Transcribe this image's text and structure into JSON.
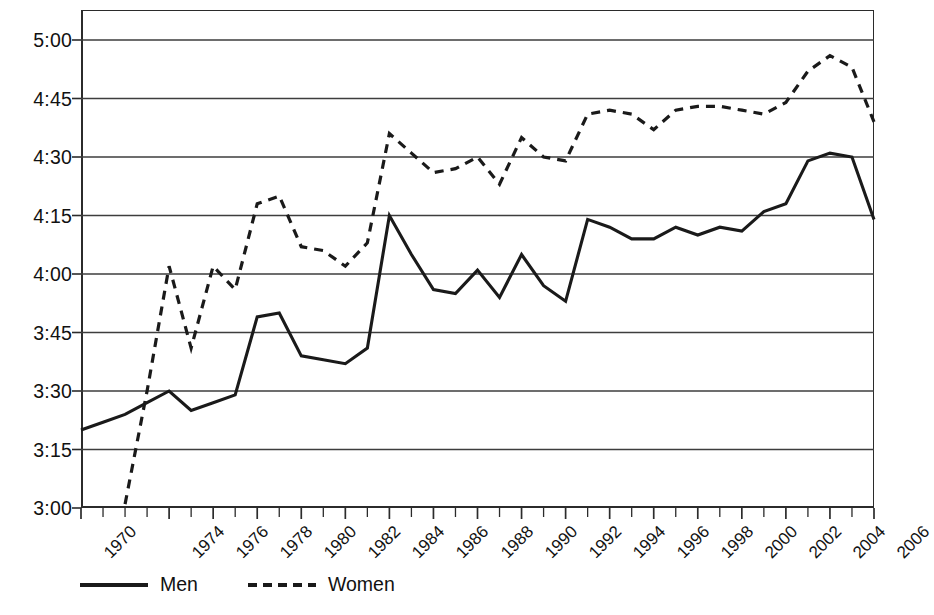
{
  "chart_data": {
    "type": "line",
    "title": "",
    "xlabel": "",
    "ylabel": "",
    "ylim": [
      "3:00",
      "5:00"
    ],
    "xlim": [
      1970,
      2006
    ],
    "grid": true,
    "legend_position": "bottom-left",
    "y_tick_labels": [
      "5:00",
      "4:45",
      "4:30",
      "4:15",
      "4:00",
      "3:45",
      "3:30",
      "3:15",
      "3:00"
    ],
    "y_tick_minutes": [
      300,
      285,
      270,
      255,
      240,
      225,
      210,
      195,
      180
    ],
    "x_tick_years": [
      1970,
      1971,
      1972,
      1973,
      1974,
      1975,
      1976,
      1977,
      1978,
      1979,
      1980,
      1981,
      1982,
      1983,
      1984,
      1985,
      1986,
      1987,
      1988,
      1989,
      1990,
      1991,
      1992,
      1993,
      1994,
      1995,
      1996,
      1997,
      1998,
      1999,
      2000,
      2001,
      2002,
      2003,
      2004,
      2005,
      2006
    ],
    "x_tick_labels": [
      "1970",
      "1974",
      "1976",
      "1978",
      "1980",
      "1982",
      "1984",
      "1986",
      "1988",
      "1990",
      "1992",
      "1994",
      "1996",
      "1998",
      "2000",
      "2002",
      "2004",
      "2006"
    ],
    "x_tick_label_years": [
      1970,
      1974,
      1976,
      1978,
      1980,
      1982,
      1984,
      1986,
      1988,
      1990,
      1992,
      1994,
      1996,
      1998,
      2000,
      2002,
      2004,
      2006
    ],
    "series": [
      {
        "name": "Men",
        "style": "solid",
        "color": "#1a1a1a",
        "x": [
          1970,
          1971,
          1972,
          1973,
          1974,
          1975,
          1976,
          1977,
          1978,
          1979,
          1980,
          1981,
          1982,
          1983,
          1984,
          1985,
          1986,
          1987,
          1988,
          1989,
          1990,
          1991,
          1992,
          1993,
          1994,
          1995,
          1996,
          1997,
          1998,
          1999,
          2000,
          2001,
          2002,
          2003,
          2004,
          2005,
          2006
        ],
        "values": [
          "3:20",
          "3:22",
          "3:24",
          "3:27",
          "3:30",
          "3:25",
          "3:27",
          "3:29",
          "3:49",
          "3:50",
          "3:39",
          "3:38",
          "3:37",
          "3:41",
          "4:15",
          "4:05",
          "3:56",
          "3:55",
          "4:01",
          "3:54",
          "4:05",
          "3:57",
          "3:53",
          "4:14",
          "4:12",
          "4:09",
          "4:09",
          "4:12",
          "4:10",
          "4:12",
          "4:11",
          "4:16",
          "4:18",
          "4:29",
          "4:31",
          "4:30",
          "4:14"
        ],
        "minutes": [
          200,
          202,
          204,
          207,
          210,
          205,
          207,
          209,
          229,
          230,
          219,
          218,
          217,
          221,
          255,
          245,
          236,
          235,
          241,
          234,
          245,
          237,
          233,
          254,
          252,
          249,
          249,
          252,
          250,
          252,
          251,
          256,
          258,
          269,
          271,
          270,
          254
        ]
      },
      {
        "name": "Women",
        "style": "dashed",
        "color": "#1a1a1a",
        "x": [
          1972,
          1973,
          1974,
          1975,
          1976,
          1977,
          1978,
          1979,
          1980,
          1981,
          1982,
          1983,
          1984,
          1985,
          1986,
          1987,
          1988,
          1989,
          1990,
          1991,
          1992,
          1993,
          1994,
          1995,
          1996,
          1997,
          1998,
          1999,
          2000,
          2001,
          2002,
          2003,
          2004,
          2005,
          2006
        ],
        "values": [
          "3:01",
          "3:30",
          "4:02",
          "3:41",
          "4:02",
          "3:56",
          "4:18",
          "4:20",
          "4:07",
          "4:06",
          "4:02",
          "4:08",
          "4:36",
          "4:31",
          "4:26",
          "4:27",
          "4:30",
          "4:23",
          "4:35",
          "4:30",
          "4:29",
          "4:41",
          "4:42",
          "4:41",
          "4:37",
          "4:42",
          "4:43",
          "4:43",
          "4:42",
          "4:41",
          "4:44",
          "4:52",
          "4:56",
          "4:53",
          "4:39"
        ],
        "minutes": [
          181,
          210,
          242,
          221,
          242,
          236,
          258,
          260,
          247,
          246,
          242,
          248,
          276,
          271,
          266,
          267,
          270,
          263,
          275,
          270,
          269,
          281,
          282,
          281,
          277,
          282,
          283,
          283,
          282,
          281,
          284,
          292,
          296,
          293,
          279
        ]
      }
    ]
  },
  "legend": {
    "men_label": "Men",
    "women_label": "Women"
  },
  "header": {
    "title": ""
  }
}
